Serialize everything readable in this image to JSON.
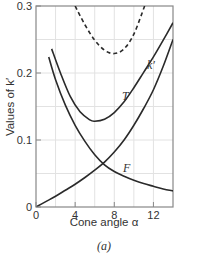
{
  "chart_data": {
    "type": "line",
    "title": "",
    "caption": "(a)",
    "xlabel": "Cone angle α",
    "ylabel": "Values of k′",
    "xlim": [
      0,
      14
    ],
    "ylim": [
      0,
      0.3
    ],
    "x_ticks": [
      "0",
      "4",
      "8",
      "12"
    ],
    "y_ticks": [
      "0",
      "0.1",
      "0.2",
      "0.3"
    ],
    "grid": true,
    "legend": "inline curve labels",
    "series": [
      {
        "name": "dashed",
        "style": "dashed",
        "x": [
          4.0,
          5.0,
          6.0,
          7.0,
          8.0,
          9.0,
          10.0,
          11.1
        ],
        "y": [
          0.3,
          0.272,
          0.249,
          0.234,
          0.229,
          0.236,
          0.258,
          0.3
        ]
      },
      {
        "name": "k′",
        "style": "solid",
        "x": [
          1.6,
          2.5,
          3.5,
          4.5,
          5.5,
          6.0,
          7.0,
          8.0,
          9.0,
          10.0,
          11.0,
          12.0,
          13.0,
          14.0
        ],
        "y": [
          0.236,
          0.2,
          0.165,
          0.142,
          0.13,
          0.128,
          0.131,
          0.141,
          0.157,
          0.178,
          0.201,
          0.224,
          0.249,
          0.275
        ]
      },
      {
        "name": "T",
        "style": "solid",
        "x": [
          0,
          1,
          2,
          3,
          4,
          5,
          6,
          7,
          8,
          9,
          10,
          11,
          12,
          13,
          14
        ],
        "y": [
          0,
          0.008,
          0.016,
          0.025,
          0.034,
          0.044,
          0.055,
          0.067,
          0.082,
          0.1,
          0.122,
          0.147,
          0.175,
          0.21,
          0.25
        ]
      },
      {
        "name": "F",
        "style": "solid",
        "x": [
          1.3,
          2,
          3,
          4,
          5,
          6,
          7,
          8,
          9,
          10,
          11,
          12,
          13,
          14
        ],
        "y": [
          0.224,
          0.19,
          0.152,
          0.122,
          0.098,
          0.078,
          0.063,
          0.053,
          0.046,
          0.04,
          0.035,
          0.031,
          0.027,
          0.024
        ]
      }
    ],
    "annotations": [
      {
        "text": "k′",
        "x": 11.8,
        "y": 0.225
      },
      {
        "text": "T",
        "x": 9.4,
        "y": 0.166
      },
      {
        "text": "F",
        "x": 9.3,
        "y": 0.072
      }
    ]
  },
  "labels": {
    "caption": "(a)",
    "xlabel": "Cone angle α",
    "ylabel": "Values of k′",
    "curve_kprime": "k′",
    "curve_T": "T",
    "curve_F": "F"
  },
  "colors": {
    "curve": "#2a2a2a",
    "axis": "#888888",
    "grid": "#e2e2e2",
    "text": "#333333"
  }
}
